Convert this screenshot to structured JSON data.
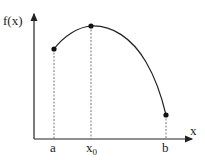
{
  "diagram": {
    "y_axis_label": "f(x)",
    "x_axis_label": "x",
    "points": [
      {
        "label": "a",
        "x": 54,
        "y": 49
      },
      {
        "label": "x",
        "sub": "0",
        "x": 91,
        "y": 26
      },
      {
        "label": "b",
        "x": 166,
        "y": 115
      }
    ],
    "colors": {
      "line": "#222222",
      "dashed": "#555555",
      "background": "#ffffff"
    }
  }
}
